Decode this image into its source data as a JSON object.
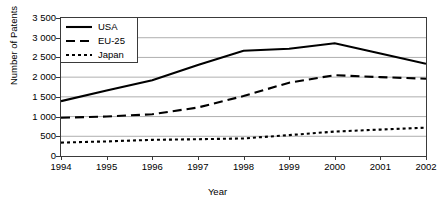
{
  "chart_data": {
    "type": "line",
    "title": "",
    "xlabel": "Year",
    "ylabel": "Number of Patents",
    "categories": [
      "1994",
      "1995",
      "1996",
      "1997",
      "1998",
      "1999",
      "2000",
      "2001",
      "2002"
    ],
    "x": [
      1994,
      1995,
      1996,
      1997,
      1998,
      1999,
      2000,
      2001,
      2002
    ],
    "series": [
      {
        "name": "USA",
        "style": "solid",
        "color": "#000000",
        "values": [
          1390,
          1660,
          1920,
          2310,
          2670,
          2720,
          2860,
          2600,
          2340
        ]
      },
      {
        "name": "EU-25",
        "style": "dashed",
        "color": "#000000",
        "values": [
          970,
          1000,
          1060,
          1230,
          1520,
          1860,
          2050,
          2000,
          1960
        ]
      },
      {
        "name": "Japan",
        "style": "dotted",
        "color": "#000000",
        "values": [
          340,
          370,
          410,
          425,
          445,
          530,
          620,
          670,
          720
        ]
      }
    ],
    "ylim": [
      0,
      3500
    ],
    "ytick_values": [
      0,
      500,
      1000,
      1500,
      2000,
      2500,
      3000,
      3500
    ],
    "ytick_labels": [
      "0",
      "500",
      "1 000",
      "1 500",
      "2 000",
      "2 500",
      "3 000",
      "3 500"
    ],
    "grid": "horizontal",
    "legend_position": "top-left",
    "legend_entries": [
      "USA",
      "EU-25",
      "Japan"
    ]
  },
  "axes": {
    "y_title": "Number of Patents",
    "x_title": "Year"
  },
  "colors": {
    "line": "#000000",
    "grid": "#9a9a9a",
    "frame": "#3a3a3a",
    "background": "#ffffff"
  }
}
